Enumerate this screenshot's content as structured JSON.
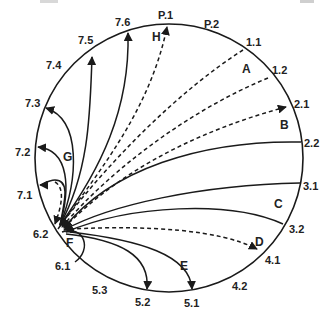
{
  "diagram": {
    "type": "circular-arc-flow",
    "circle": {
      "cx": 169,
      "cy": 158,
      "r": 134,
      "stroke": "#1a1a1a"
    },
    "hub": {
      "label": "F",
      "x": 58,
      "y": 229
    },
    "point_labels": [
      {
        "id": "P.1",
        "text": "P.1",
        "x": 158,
        "y": 19
      },
      {
        "id": "P.2",
        "text": "P.2",
        "x": 204,
        "y": 28
      },
      {
        "id": "1.1",
        "text": "1.1",
        "x": 246,
        "y": 46
      },
      {
        "id": "1.2",
        "text": "1.2",
        "x": 272,
        "y": 74
      },
      {
        "id": "2.1",
        "text": "2.1",
        "x": 294,
        "y": 108
      },
      {
        "id": "2.2",
        "text": "2.2",
        "x": 304,
        "y": 147
      },
      {
        "id": "3.1",
        "text": "3.1",
        "x": 303,
        "y": 190
      },
      {
        "id": "3.2",
        "text": "3.2",
        "x": 289,
        "y": 233
      },
      {
        "id": "4.1",
        "text": "4.1",
        "x": 265,
        "y": 264
      },
      {
        "id": "4.2",
        "text": "4.2",
        "x": 232,
        "y": 290
      },
      {
        "id": "5.1",
        "text": "5.1",
        "x": 184,
        "y": 307
      },
      {
        "id": "5.2",
        "text": "5.2",
        "x": 135,
        "y": 306
      },
      {
        "id": "5.3",
        "text": "5.3",
        "x": 92,
        "y": 294
      },
      {
        "id": "6.1",
        "text": "6.1",
        "x": 55,
        "y": 270
      },
      {
        "id": "6.2",
        "text": "6.2",
        "x": 33,
        "y": 238
      },
      {
        "id": "7.1",
        "text": "7.1",
        "x": 17,
        "y": 199
      },
      {
        "id": "7.2",
        "text": "7.2",
        "x": 15,
        "y": 156
      },
      {
        "id": "7.3",
        "text": "7.3",
        "x": 25,
        "y": 107
      },
      {
        "id": "7.4",
        "text": "7.4",
        "x": 46,
        "y": 69
      },
      {
        "id": "7.5",
        "text": "7.5",
        "x": 78,
        "y": 44
      },
      {
        "id": "7.6",
        "text": "7.6",
        "x": 115,
        "y": 26
      }
    ],
    "region_labels": [
      {
        "text": "H",
        "x": 152,
        "y": 41
      },
      {
        "text": "A",
        "x": 242,
        "y": 73
      },
      {
        "text": "B",
        "x": 280,
        "y": 129
      },
      {
        "text": "C",
        "x": 274,
        "y": 208
      },
      {
        "text": "D",
        "x": 255,
        "y": 246
      },
      {
        "text": "E",
        "x": 180,
        "y": 270
      },
      {
        "text": "F",
        "x": 66,
        "y": 247
      },
      {
        "text": "G",
        "x": 63,
        "y": 161
      }
    ],
    "edges": [
      {
        "from": "P.1",
        "to": "hub",
        "style": "dashed",
        "arrow": "both-circle-end",
        "d": "M58,229 C100,170 150,110 167,27"
      },
      {
        "from": "1.1",
        "to": "hub",
        "style": "dashed",
        "arrow": "hub",
        "d": "M243,50 C180,90 110,160 60,226"
      },
      {
        "from": "1.2",
        "to": "hub",
        "style": "dashed",
        "arrow": "hub",
        "d": "M268,78 C190,110 110,170 62,227"
      },
      {
        "from": "2.1",
        "to": "hub",
        "style": "dashed",
        "arrow": "both-circle-end",
        "d": "M64,228 C120,170 200,130 286,107"
      },
      {
        "from": "2.2",
        "to": "hub",
        "style": "solid",
        "arrow": "hub",
        "d": "M301,142 C200,140 110,170 64,228"
      },
      {
        "from": "3.1",
        "to": "hub",
        "style": "solid",
        "arrow": "hub",
        "d": "M300,183 C200,185 110,205 64,230"
      },
      {
        "from": "3.2",
        "to": "hub",
        "style": "solid",
        "arrow": "hub",
        "d": "M283,224 C230,200 130,205 66,232"
      },
      {
        "from": "hub",
        "to": "4.1",
        "style": "dashed",
        "arrow": "circle-end",
        "d": "M70,229 C150,225 220,230 257,249"
      },
      {
        "from": "hub",
        "to": "5.1",
        "style": "solid",
        "arrow": "circle-end",
        "d": "M70,232 C140,240 190,255 192,289"
      },
      {
        "from": "hub",
        "to": "5.2",
        "style": "solid",
        "arrow": "circle-end",
        "d": "M66,234 C120,240 150,255 147,289"
      },
      {
        "from": "hub",
        "to": "6.1",
        "style": "solid",
        "arrow": "none",
        "d": "M62,232 C85,225 92,250 75,262"
      },
      {
        "from": "hub",
        "to": "7.1",
        "style": "solid",
        "arrow": "circle-end",
        "d": "M60,225 C65,200 70,180 55,180 C48,180 42,185 40,185"
      },
      {
        "from": "7.1",
        "to": "hub",
        "style": "dashed",
        "arrow": "hub",
        "d": "M55,182 C65,188 62,205 55,224"
      },
      {
        "from": "hub",
        "to": "7.2",
        "style": "solid",
        "arrow": "circle-end",
        "d": "M60,225 C70,190 70,150 38,147"
      },
      {
        "from": "hub",
        "to": "7.3",
        "style": "solid",
        "arrow": "circle-end",
        "d": "M60,225 C78,180 82,120 46,108"
      },
      {
        "from": "hub",
        "to": "7.5",
        "style": "solid",
        "arrow": "circle-end",
        "d": "M60,225 C90,170 90,110 92,57"
      },
      {
        "from": "hub",
        "to": "7.6",
        "style": "solid",
        "arrow": "circle-end",
        "d": "M60,225 C100,170 130,110 128,33"
      }
    ],
    "cropped_top_text": "(partially visible text at top edge, cropped)"
  }
}
